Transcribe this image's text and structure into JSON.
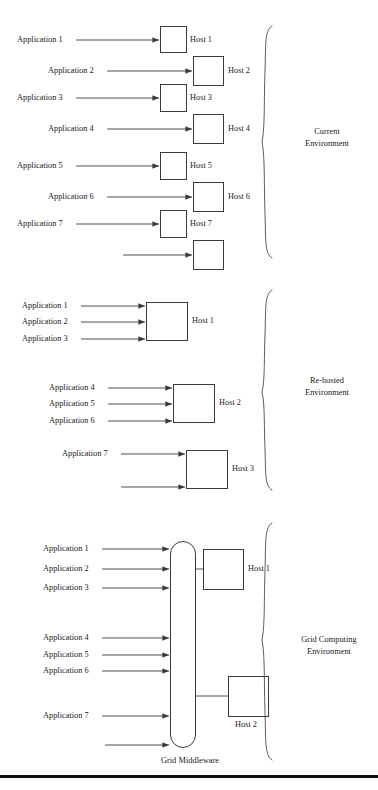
{
  "figure": {
    "background_color": "#ffffff",
    "line_color": "#3a3a3a",
    "text_color": "#1a1a1a",
    "footer_rule_color": "#101010"
  },
  "sections": [
    {
      "id": "current",
      "env_label_line1": "Current",
      "env_label_line2": "Environment",
      "applications": [
        {
          "label": "Application 1"
        },
        {
          "label": "Application 2"
        },
        {
          "label": "Application 3"
        },
        {
          "label": "Application 4"
        },
        {
          "label": "Application 5"
        },
        {
          "label": "Application 6"
        },
        {
          "label": "Application 7"
        }
      ],
      "hosts": [
        {
          "label": "Host 1"
        },
        {
          "label": "Host 2"
        },
        {
          "label": "Host 3"
        },
        {
          "label": "Host 4"
        },
        {
          "label": "Host 5"
        },
        {
          "label": "Host 6"
        },
        {
          "label": "Host 7"
        },
        {
          "label": ""
        }
      ]
    },
    {
      "id": "rehosted",
      "env_label_line1": "Re-hosted",
      "env_label_line2": "Environment",
      "applications": [
        {
          "label": "Application 1"
        },
        {
          "label": "Application 2"
        },
        {
          "label": "Application 3"
        },
        {
          "label": "Application 4"
        },
        {
          "label": "Application 5"
        },
        {
          "label": "Application 6"
        },
        {
          "label": "Application 7"
        }
      ],
      "hosts": [
        {
          "label": "Host 1"
        },
        {
          "label": "Host 2"
        },
        {
          "label": "Host 3"
        }
      ]
    },
    {
      "id": "grid",
      "env_label_line1": "Grid Computing",
      "env_label_line2": "Environment",
      "middleware_label": "Grid Middleware",
      "applications": [
        {
          "label": "Application 1"
        },
        {
          "label": "Application 2"
        },
        {
          "label": "Application 3"
        },
        {
          "label": "Application 4"
        },
        {
          "label": "Application 5"
        },
        {
          "label": "Application 6"
        },
        {
          "label": "Application 7"
        }
      ],
      "hosts": [
        {
          "label": "Host 1"
        },
        {
          "label": "Host 2"
        }
      ]
    }
  ]
}
